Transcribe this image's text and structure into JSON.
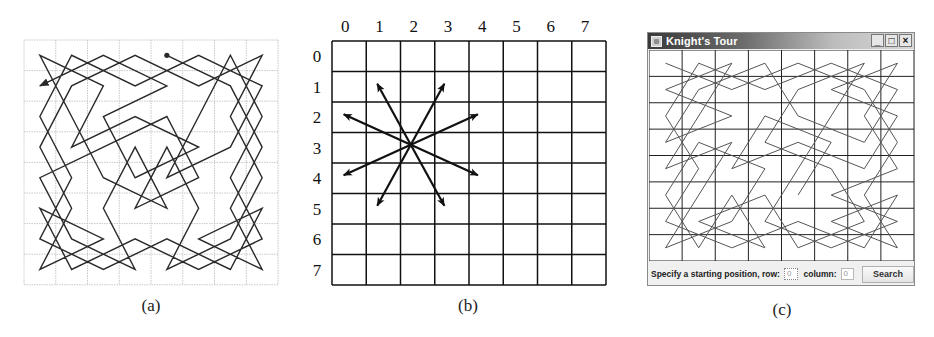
{
  "figure": {
    "panels": [
      {
        "id": "a",
        "caption": "(a)"
      },
      {
        "id": "b",
        "caption": "(b)"
      },
      {
        "id": "c",
        "caption": "(c)"
      }
    ]
  },
  "panel_a": {
    "caption": "(a)",
    "board_size": 8,
    "grid_style": "dotted-light",
    "start": [
      0,
      4
    ],
    "end_arrow": true,
    "line_color": "#2a2a2a",
    "grid_color": "#c8c8c8"
  },
  "panel_b": {
    "caption": "(b)",
    "column_labels": [
      "0",
      "1",
      "2",
      "3",
      "4",
      "5",
      "6",
      "7"
    ],
    "row_labels": [
      "0",
      "1",
      "2",
      "3",
      "4",
      "5",
      "6",
      "7"
    ],
    "knight_position": {
      "row": 3,
      "column": 2
    },
    "moves": [
      {
        "to": [
          1,
          1
        ]
      },
      {
        "to": [
          1,
          3
        ]
      },
      {
        "to": [
          2,
          0
        ]
      },
      {
        "to": [
          2,
          4
        ]
      },
      {
        "to": [
          4,
          0
        ]
      },
      {
        "to": [
          4,
          4
        ]
      },
      {
        "to": [
          5,
          1
        ]
      },
      {
        "to": [
          5,
          3
        ]
      }
    ],
    "line_color": "#111111"
  },
  "panel_c": {
    "caption": "(c)",
    "window_title": "Knight's Tour",
    "window_buttons": [
      "_",
      "□",
      "×"
    ],
    "board_size": 8,
    "start": [
      0,
      0
    ],
    "controls": {
      "prompt_label": "Specify a starting position, row:",
      "row_value": "0",
      "column_label": "column:",
      "column_value": "0",
      "search_button": "Search"
    },
    "line_color": "#555555",
    "grid_color": "#222222"
  }
}
